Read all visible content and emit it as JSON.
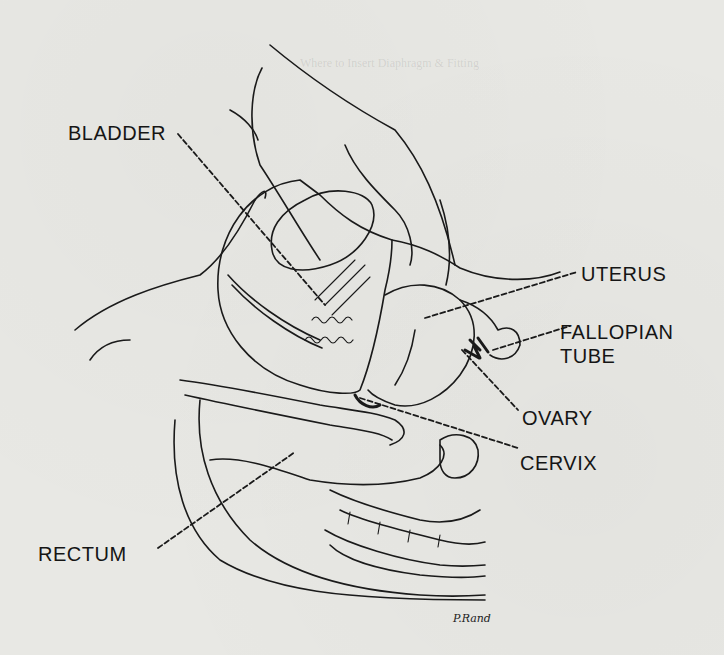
{
  "figure": {
    "labels": {
      "bladder": "BLADDER",
      "uterus": "UTERUS",
      "fallopian_line1": "FALLOPIAN",
      "fallopian_line2": "TUBE",
      "ovary": "OVARY",
      "cervix": "CERVIX",
      "rectum": "RECTUM"
    },
    "signature": "P.Rand",
    "background_text_heading": "Where to Insert Diaphragm & Fitting"
  }
}
